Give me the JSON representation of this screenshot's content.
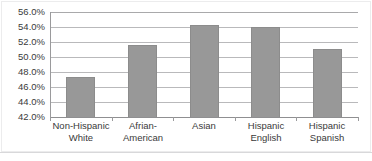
{
  "chart_data": {
    "type": "bar",
    "title": "",
    "subtitle": "",
    "xlabel": "",
    "ylabel": "",
    "categories": [
      "Non-Hispanic\nWhite",
      "Afrian-\nAmerican",
      "Asian",
      "Hispanic\nEnglish",
      "Hispanic\nSpanish"
    ],
    "values": [
      47.3,
      51.6,
      54.2,
      54.0,
      51.0
    ],
    "value_labels": [
      "47.3%",
      "51.6%",
      "54.2%",
      "54.0%",
      "51.0%"
    ],
    "ylim": [
      42.0,
      56.0
    ],
    "ytick_values": [
      42.0,
      44.0,
      46.0,
      48.0,
      50.0,
      52.0,
      54.0,
      56.0
    ],
    "ytick_labels": [
      "42.0%",
      "44.0%",
      "46.0%",
      "48.0%",
      "50.0%",
      "52.0%",
      "54.0%",
      "56.0%"
    ],
    "grid": true,
    "grid_axis": "y",
    "legend": false,
    "legend_position": "none",
    "series": [
      {
        "name": "",
        "values": [
          47.3,
          51.6,
          54.2,
          54.0,
          51.0
        ]
      }
    ],
    "colors": {
      "bar_fill": "#989898",
      "bar_border": "#8c8c8c",
      "gridline": "#b9b9bb",
      "axis": "#8f8f91",
      "text": "#3a3a3a",
      "background": "#ffffff",
      "frame": "#ececed"
    }
  }
}
